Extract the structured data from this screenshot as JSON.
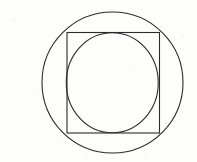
{
  "figure": {
    "title": "Circle inscribed in a square inscribed in a circle",
    "background_color": "#fdfdfc",
    "stroke_color": "#2b2b2b",
    "stroke_width": 1.1,
    "canvas": {
      "width": 197,
      "height": 162
    },
    "shapes": [
      {
        "id": "outer-circle",
        "type": "circle",
        "label": "Outer circle (circumscribes the square)",
        "cx": 112.5,
        "cy": 82.5,
        "r": 70.5,
        "stroke": "#2b2b2b",
        "stroke_width": 1.1,
        "fill": "none"
      },
      {
        "id": "square",
        "type": "rect",
        "label": "Square (inscribed in outer circle)",
        "x": 67,
        "y": 32.5,
        "width": 92.5,
        "height": 100.5,
        "stroke": "#2b2b2b",
        "stroke_width": 1.1,
        "fill": "none"
      },
      {
        "id": "inner-circle",
        "type": "circle",
        "label": "Inner circle (inscribed in the square)",
        "cx": 112.25,
        "cy": 82.75,
        "rx": 46.0,
        "ry": 50.0,
        "stroke": "#2b2b2b",
        "stroke_width": 1.1,
        "fill": "none"
      }
    ]
  }
}
